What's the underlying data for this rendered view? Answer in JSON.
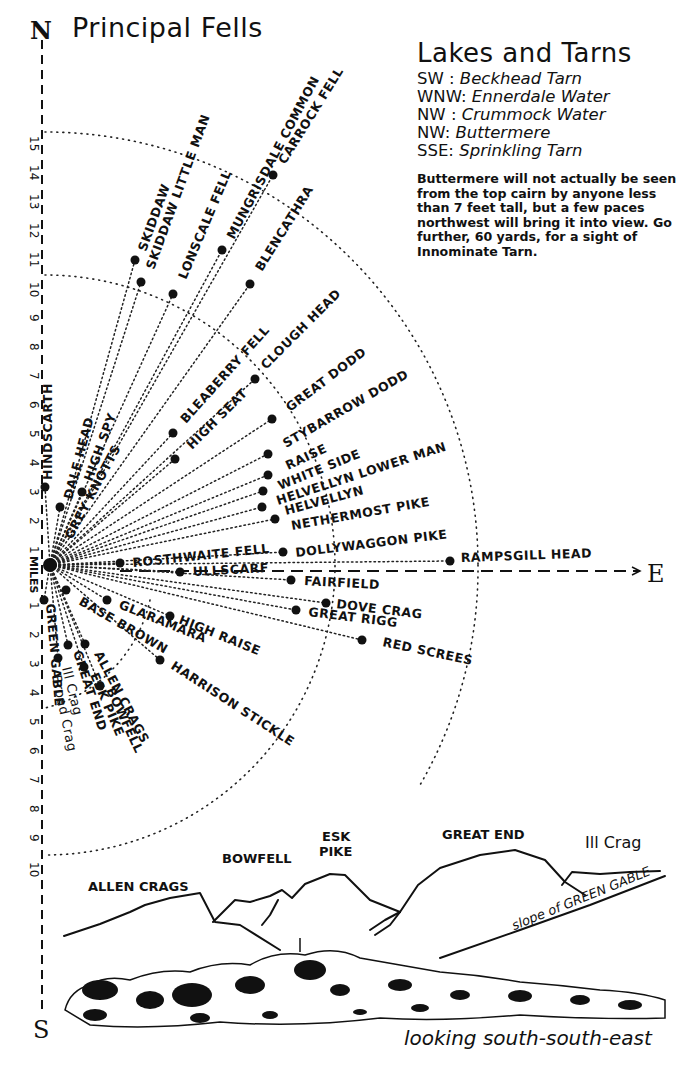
{
  "compass": {
    "north": "N",
    "east": "E",
    "south": "S"
  },
  "principal_fells": {
    "title": "Principal Fells",
    "scale": {
      "unit_label": "MILES",
      "north_ticks": [
        "1",
        "2",
        "3",
        "4",
        "5",
        "6",
        "7",
        "8",
        "9",
        "10",
        "11",
        "12",
        "13",
        "14",
        "15"
      ],
      "south_ticks": [
        "1",
        "2",
        "3",
        "4",
        "5",
        "6",
        "7",
        "8",
        "9",
        "10"
      ]
    },
    "fells": [
      {
        "name": "HINDSCARTH"
      },
      {
        "name": "DALE HEAD"
      },
      {
        "name": "HIGH SPY"
      },
      {
        "name": "GREY KNOTTS"
      },
      {
        "name": "SKIDDAW"
      },
      {
        "name": "SKIDDAW LITTLE MAN"
      },
      {
        "name": "LONSCALE FELL"
      },
      {
        "name": "MUNGRISDALE COMMON"
      },
      {
        "name": "CARROCK FELL"
      },
      {
        "name": "BLENCATHRA"
      },
      {
        "name": "BLEABERRY FELL"
      },
      {
        "name": "HIGH SEAT"
      },
      {
        "name": "CLOUGH HEAD"
      },
      {
        "name": "GREAT DODD"
      },
      {
        "name": "STYBARROW DODD"
      },
      {
        "name": "RAISE"
      },
      {
        "name": "WHITE SIDE"
      },
      {
        "name": "HELVELLYN LOWER MAN"
      },
      {
        "name": "HELVELLYN"
      },
      {
        "name": "NETHERMOST PIKE"
      },
      {
        "name": "DOLLYWAGGON PIKE"
      },
      {
        "name": "ROSTHWAITE FELL"
      },
      {
        "name": "ULLSCARF"
      },
      {
        "name": "RAMPSGILL HEAD"
      },
      {
        "name": "FAIRFIELD"
      },
      {
        "name": "DOVE CRAG"
      },
      {
        "name": "GREAT RIGG"
      },
      {
        "name": "RED SCREES"
      },
      {
        "name": "BASE BROWN"
      },
      {
        "name": "GLARAMARA"
      },
      {
        "name": "HIGH RAISE"
      },
      {
        "name": "HARRISON STICKLE"
      },
      {
        "name": "ALLEN CRAGS"
      },
      {
        "name": "BOWFELL"
      },
      {
        "name": "ESK PIKE"
      },
      {
        "name": "GREAT END"
      },
      {
        "name": "Ill Crag"
      },
      {
        "name": "Broad Crag"
      },
      {
        "name": "GREEN GABLE"
      }
    ]
  },
  "lakes_and_tarns": {
    "title": "Lakes and Tarns",
    "items": [
      {
        "direction": "SW :",
        "name": "Beckhead Tarn"
      },
      {
        "direction": "WNW:",
        "name": "Ennerdale Water"
      },
      {
        "direction": "NW :",
        "name": "Crummock Water"
      },
      {
        "direction": "NW:",
        "name": "Buttermere"
      },
      {
        "direction": "SSE:",
        "name": "Sprinkling Tarn"
      }
    ],
    "note": "Buttermere will not actually be seen from the top cairn by anyone less than 7 feet tall, but a few paces northwest will bring it into view.   Go further, 60 yards, for a sight of Innominate Tarn."
  },
  "view_sketch": {
    "ridge_labels": {
      "allen_crags": "ALLEN CRAGS",
      "bowfell": "BOWFELL",
      "esk_pike_1": "ESK",
      "esk_pike_2": "PIKE",
      "great_end": "GREAT END",
      "ill_crag": "Ill Crag",
      "slope": "slope of GREEN GABLE"
    },
    "caption": "looking south-south-east"
  }
}
